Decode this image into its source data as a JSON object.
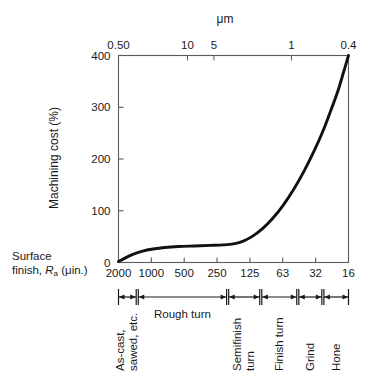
{
  "figure": {
    "top_axis_title": "μm",
    "y_axis_title": "Machining cost (%)",
    "surface_finish_caption_line1": "Surface",
    "surface_finish_caption_line2_pre": "finish, ",
    "surface_finish_caption_line2_italic": "R",
    "surface_finish_caption_line2_sub": "a",
    "surface_finish_caption_line2_post": " (μin.)"
  },
  "chart_data": {
    "type": "line",
    "title": "",
    "subtitle": "",
    "xlabel": "Surface finish, Ra (μin.)",
    "ylabel": "Machining cost (%)",
    "x2label": "μm",
    "ylim": [
      0,
      400
    ],
    "yticks": [
      0,
      100,
      200,
      300,
      400
    ],
    "ytick_labels": [
      "0",
      "100",
      "200",
      "300",
      "400"
    ],
    "grid": false,
    "legend": "none",
    "x_axis_scale": "log-reversed",
    "xtick_labels": [
      "2000",
      "1000",
      "500",
      "250",
      "125",
      "63",
      "32",
      "16"
    ],
    "xtick_positions_frac": [
      0.0,
      0.1428,
      0.2857,
      0.4285,
      0.5714,
      0.7142,
      0.8571,
      1.0
    ],
    "x2tick_labels": [
      "0.50",
      "10",
      "5",
      "1",
      "0.4"
    ],
    "x2tick_positions_frac": [
      0.0,
      0.3,
      0.415,
      0.752,
      1.0
    ],
    "series": [
      {
        "name": "Machining cost",
        "points": [
          {
            "x_frac": 0.0,
            "y": 2
          },
          {
            "x_frac": 0.03,
            "y": 9
          },
          {
            "x_frac": 0.065,
            "y": 16
          },
          {
            "x_frac": 0.105,
            "y": 22
          },
          {
            "x_frac": 0.15,
            "y": 26
          },
          {
            "x_frac": 0.2,
            "y": 29
          },
          {
            "x_frac": 0.26,
            "y": 31
          },
          {
            "x_frac": 0.33,
            "y": 32
          },
          {
            "x_frac": 0.4,
            "y": 33
          },
          {
            "x_frac": 0.455,
            "y": 34
          },
          {
            "x_frac": 0.5,
            "y": 36
          },
          {
            "x_frac": 0.54,
            "y": 41
          },
          {
            "x_frac": 0.58,
            "y": 50
          },
          {
            "x_frac": 0.625,
            "y": 65
          },
          {
            "x_frac": 0.67,
            "y": 85
          },
          {
            "x_frac": 0.715,
            "y": 110
          },
          {
            "x_frac": 0.76,
            "y": 140
          },
          {
            "x_frac": 0.805,
            "y": 175
          },
          {
            "x_frac": 0.85,
            "y": 215
          },
          {
            "x_frac": 0.89,
            "y": 255
          },
          {
            "x_frac": 0.925,
            "y": 296
          },
          {
            "x_frac": 0.955,
            "y": 333
          },
          {
            "x_frac": 0.98,
            "y": 370
          },
          {
            "x_frac": 1.0,
            "y": 400
          }
        ]
      }
    ],
    "process_ranges": [
      {
        "label": "As-cast,\nsawed, etc.",
        "line1": "As-cast,",
        "line2": "sawed, etc.",
        "start_frac": 0.0,
        "end_frac": 0.077,
        "orientation": "vertical"
      },
      {
        "label": "Rough turn",
        "line1": "Rough turn",
        "line2": "",
        "start_frac": 0.086,
        "end_frac": 0.47,
        "orientation": "horizontal"
      },
      {
        "label": "Semifinish\nturn",
        "line1": "Semifinish",
        "line2": "turn",
        "start_frac": 0.479,
        "end_frac": 0.614,
        "orientation": "vertical"
      },
      {
        "label": "Finish turn",
        "line1": "Finish turn",
        "line2": "",
        "start_frac": 0.623,
        "end_frac": 0.775,
        "orientation": "vertical"
      },
      {
        "label": "Grind",
        "line1": "Grind",
        "line2": "",
        "start_frac": 0.784,
        "end_frac": 0.884,
        "orientation": "vertical"
      },
      {
        "label": "Hone",
        "line1": "Hone",
        "line2": "",
        "start_frac": 0.893,
        "end_frac": 1.0,
        "orientation": "vertical"
      }
    ],
    "colors": {
      "curve": "#111111",
      "axis": "#5a5a5a",
      "text": "#1a1a1a",
      "background": "#ffffff"
    }
  }
}
